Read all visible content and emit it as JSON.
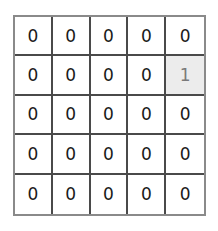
{
  "grid": {
    "rows": 5,
    "cols": 5,
    "highlight_color": "#ececec",
    "highlighted_cell": {
      "row": 1,
      "col": 4
    },
    "values": [
      [
        "0",
        "0",
        "0",
        "0",
        "0"
      ],
      [
        "0",
        "0",
        "0",
        "0",
        "1"
      ],
      [
        "0",
        "0",
        "0",
        "0",
        "0"
      ],
      [
        "0",
        "0",
        "0",
        "0",
        "0"
      ],
      [
        "0",
        "0",
        "0",
        "0",
        "0"
      ]
    ]
  }
}
